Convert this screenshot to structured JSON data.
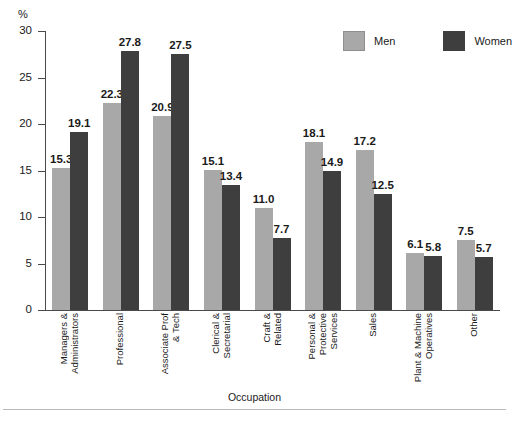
{
  "chart_data": {
    "type": "bar",
    "title": "",
    "xlabel": "Occupation",
    "ylabel": "%",
    "ylim": [
      0,
      30
    ],
    "yticks": [
      0,
      5,
      10,
      15,
      20,
      25,
      30
    ],
    "ytick_labels": [
      "0",
      "5",
      "10",
      "15",
      "20",
      "25",
      "30"
    ],
    "grid": false,
    "legend_position": "top-right",
    "categories": [
      "Managers & Administrators",
      "Professional",
      "Associate Prof & Tech",
      "Clerical & Secretarial",
      "Craft & Related",
      "Personal & Protective Services",
      "Sales",
      "Plant & Machine Operatives",
      "Other"
    ],
    "category_label_lines": [
      [
        "Managers &",
        "Administrators"
      ],
      [
        "Professional"
      ],
      [
        "Associate Prof",
        "& Tech"
      ],
      [
        "Clerical &",
        "Secretarial"
      ],
      [
        "Craft &",
        "Related"
      ],
      [
        "Personal &",
        "Protective",
        "Services"
      ],
      [
        "Sales"
      ],
      [
        "Plant & Machine",
        "Operatives"
      ],
      [
        "Other"
      ]
    ],
    "series": [
      {
        "name": "Men",
        "color": "#a8a8a8",
        "values": [
          15.3,
          22.3,
          20.9,
          15.1,
          11.0,
          18.1,
          17.2,
          6.1,
          7.5
        ],
        "value_labels": [
          "15.3",
          "22.3",
          "20.9",
          "15.1",
          "11.0",
          "18.1",
          "17.2",
          "6.1",
          "7.5"
        ]
      },
      {
        "name": "Women",
        "color": "#3e3e3e",
        "values": [
          19.1,
          27.8,
          27.5,
          13.4,
          7.7,
          14.9,
          12.5,
          5.8,
          5.7
        ],
        "value_labels": [
          "19.1",
          "27.8",
          "27.5",
          "13.4",
          "7.7",
          "14.9",
          "12.5",
          "5.8",
          "5.7"
        ]
      }
    ]
  },
  "legend": {
    "men_label": "Men",
    "women_label": "Women"
  },
  "axis": {
    "y_unit": "%",
    "x_title": "Occupation"
  },
  "colors": {
    "men": "#a8a8a8",
    "women": "#3e3e3e",
    "axis": "#4a4a4a",
    "text": "#1a1a1a"
  }
}
